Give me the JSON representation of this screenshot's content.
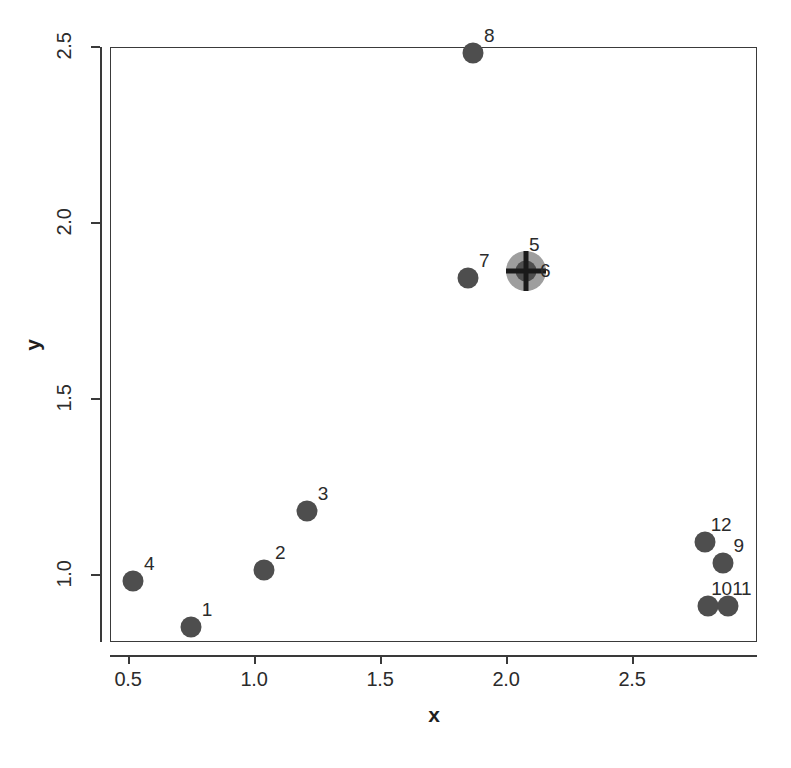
{
  "chart_data": {
    "type": "scatter",
    "title": "",
    "subtitle": "",
    "xlabel": "x",
    "ylabel": "y",
    "xlim": [
      0.37,
      2.94
    ],
    "ylim": [
      0.79,
      2.56
    ],
    "xticks": [
      0.5,
      1.0,
      1.5,
      2.0,
      2.5
    ],
    "xtick_labels": [
      "0.5",
      "1.0",
      "1.5",
      "2.0",
      "2.5"
    ],
    "yticks": [
      1.0,
      1.5,
      2.0,
      2.5
    ],
    "ytick_labels": [
      "1.0",
      "1.5",
      "2.0",
      "2.5"
    ],
    "grid": false,
    "legend": null,
    "point_color": "#4e4e4e",
    "marker_ring_color": "#9e9e9e",
    "crosshair_color": "#1a1a1a",
    "axis_color": "#3a3a3a",
    "background": "#ffffff",
    "points": [
      {
        "label": "1",
        "x": 0.75,
        "y": 0.85,
        "marker": "dot",
        "label_dx": 16,
        "label_dy": -17
      },
      {
        "label": "2",
        "x": 1.04,
        "y": 1.01,
        "marker": "dot",
        "label_dx": 16,
        "label_dy": -17
      },
      {
        "label": "3",
        "x": 1.21,
        "y": 1.18,
        "marker": "dot",
        "label_dx": 16,
        "label_dy": -17
      },
      {
        "label": "4",
        "x": 0.52,
        "y": 0.98,
        "marker": "dot",
        "label_dx": 16,
        "label_dy": -17
      },
      {
        "label": "5",
        "x": 2.08,
        "y": 1.86,
        "marker": "crosshair",
        "label_dx": 8,
        "label_dy": -26
      },
      {
        "label": "6",
        "x": 2.1,
        "y": 1.85,
        "marker": "hidden",
        "label_dx": 14,
        "label_dy": -4
      },
      {
        "label": "7",
        "x": 1.85,
        "y": 1.84,
        "marker": "dot",
        "label_dx": 16,
        "label_dy": -17
      },
      {
        "label": "8",
        "x": 1.87,
        "y": 2.48,
        "marker": "dot",
        "label_dx": 16,
        "label_dy": -17
      },
      {
        "label": "9",
        "x": 2.86,
        "y": 1.03,
        "marker": "dot",
        "label_dx": 16,
        "label_dy": -17
      },
      {
        "label": "10",
        "x": 2.8,
        "y": 0.91,
        "marker": "dot",
        "label_dx": 14,
        "label_dy": -17
      },
      {
        "label": "11",
        "x": 2.88,
        "y": 0.91,
        "marker": "dot",
        "label_dx": 14,
        "label_dy": -17
      },
      {
        "label": "12",
        "x": 2.79,
        "y": 1.09,
        "marker": "dot",
        "label_dx": 16,
        "label_dy": -17
      }
    ]
  },
  "geometry": {
    "plot_left": 110,
    "plot_top": 47,
    "plot_right": 757,
    "plot_bottom": 642,
    "x_ref_value": 0.5,
    "x_ref_px": 128,
    "x_px_per_unit": 252,
    "y_ref_value": 2.0,
    "y_ref_px": 222,
    "y_px_per_unit": 352,
    "dot_size": 21,
    "crosshair_ring_size": 40,
    "crosshair_inner_dot_size": 21,
    "crosshair_bar_length": 40,
    "crosshair_bar_thickness": 5
  }
}
